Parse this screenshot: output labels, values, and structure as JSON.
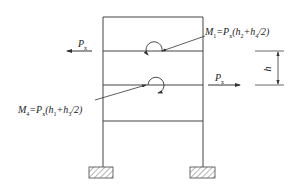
{
  "diagram": {
    "title": "",
    "type": "portal frame with lateral loads and moments",
    "colors": {
      "line": "#444444",
      "text": "#222222",
      "background": "#ffffff"
    },
    "frame": {
      "left_column_x": 103,
      "right_column_x": 203,
      "beam_levels_y": [
        17,
        51,
        85,
        121
      ],
      "column_bottom_y": 167
    },
    "loads": {
      "upper": {
        "label": "P",
        "subscript": "x",
        "direction": "left"
      },
      "lower": {
        "label": "P",
        "subscript": "x",
        "direction": "right"
      }
    },
    "moments": {
      "m1": {
        "name": "M",
        "index": "1",
        "formula_tail": "=P",
        "formula_sub": "x",
        "formula_rest": "(h",
        "h_a": "2",
        "plus": "+h",
        "h_b": "4",
        "end": "/2)",
        "full_text": "M1=Px(h2+h4/2)"
      },
      "m4": {
        "name": "M",
        "index": "4",
        "formula_tail": "=P",
        "formula_sub": "x",
        "formula_rest": "(h",
        "h_a": "1",
        "plus": "+h",
        "h_b": "3",
        "end": "/2)",
        "full_text": "M4=Px(h1+h3/2)"
      }
    },
    "dimension": {
      "label": "h"
    },
    "supports": [
      {
        "name": "left-footing",
        "type": "fixed-hatched"
      },
      {
        "name": "right-footing",
        "type": "fixed-hatched"
      }
    ]
  }
}
